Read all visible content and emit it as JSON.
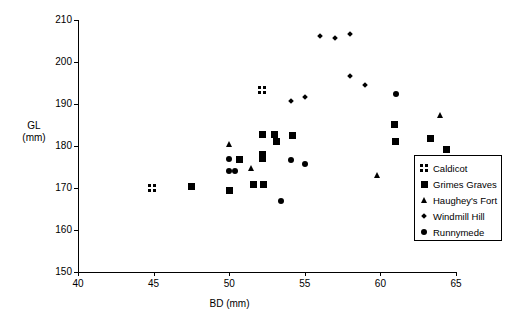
{
  "chart_data": {
    "type": "scatter",
    "title": "",
    "xlabel": "BD (mm)",
    "ylabel_line1": "GL",
    "ylabel_line2": "(mm)",
    "xlim": [
      40,
      65
    ],
    "ylim": [
      150,
      210
    ],
    "xticks": [
      40,
      45,
      50,
      55,
      60,
      65
    ],
    "yticks": [
      150,
      160,
      170,
      180,
      190,
      200,
      210
    ],
    "grid": false,
    "legend_position": "right-inside",
    "series": [
      {
        "name": "Caldicot",
        "marker": "grid2x2",
        "points": [
          [
            44.9,
            170.0
          ],
          [
            52.2,
            193.3
          ]
        ]
      },
      {
        "name": "Grimes Graves",
        "marker": "square",
        "points": [
          [
            47.5,
            170.3
          ],
          [
            50.0,
            169.4
          ],
          [
            50.7,
            176.8
          ],
          [
            51.6,
            170.8
          ],
          [
            52.2,
            182.8
          ],
          [
            52.2,
            177.9
          ],
          [
            52.2,
            177.0
          ],
          [
            52.3,
            170.8
          ],
          [
            53.0,
            182.8
          ],
          [
            53.1,
            181.0
          ],
          [
            54.2,
            182.6
          ],
          [
            60.9,
            185.2
          ],
          [
            61.0,
            181.0
          ],
          [
            63.3,
            181.7
          ],
          [
            64.4,
            179.2
          ]
        ]
      },
      {
        "name": "Haughey's Fort",
        "marker": "triangle",
        "points": [
          [
            50.0,
            180.5
          ],
          [
            51.5,
            174.7
          ],
          [
            59.8,
            173.0
          ],
          [
            64.0,
            187.4
          ]
        ]
      },
      {
        "name": "Windmill Hill",
        "marker": "diamond",
        "points": [
          [
            54.1,
            190.7
          ],
          [
            55.0,
            191.6
          ],
          [
            56.0,
            206.2
          ],
          [
            57.0,
            205.8
          ],
          [
            58.0,
            206.6
          ],
          [
            58.0,
            196.6
          ],
          [
            59.0,
            194.6
          ]
        ]
      },
      {
        "name": "Runnymede",
        "marker": "circle",
        "points": [
          [
            50.0,
            176.8
          ],
          [
            50.0,
            174.0
          ],
          [
            50.4,
            174.0
          ],
          [
            53.4,
            166.8
          ],
          [
            54.1,
            176.7
          ],
          [
            55.0,
            175.8
          ],
          [
            61.0,
            192.5
          ]
        ]
      }
    ]
  },
  "legend": {
    "entries": [
      {
        "label": "Caldicot",
        "marker": "grid2x2"
      },
      {
        "label": "Grimes Graves",
        "marker": "square"
      },
      {
        "label": "Haughey's Fort",
        "marker": "triangle"
      },
      {
        "label": "Windmill Hill",
        "marker": "diamond"
      },
      {
        "label": "Runnymede",
        "marker": "circle"
      }
    ]
  }
}
